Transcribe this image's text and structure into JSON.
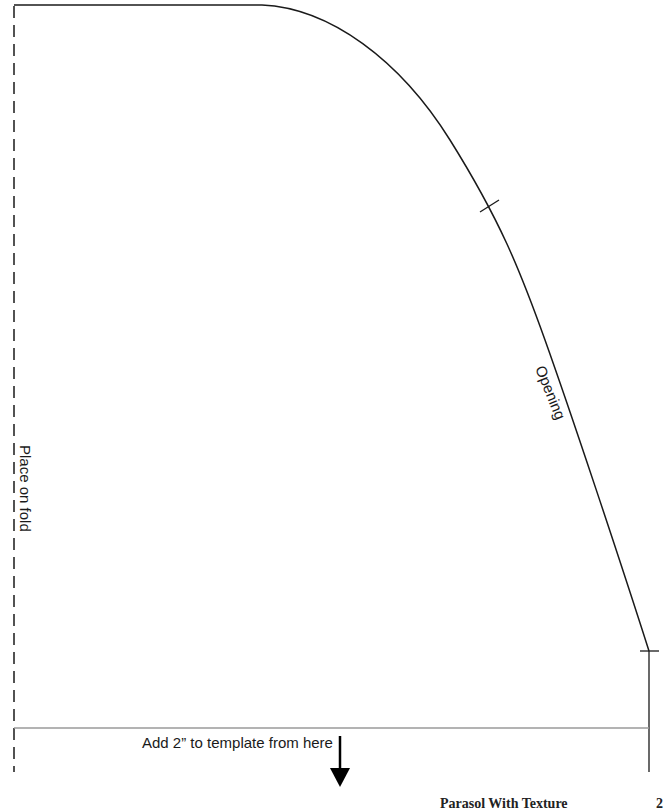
{
  "template": {
    "fold_label": "Place on fold",
    "opening_label": "Opening",
    "extension_label": "Add 2” to template from here",
    "notches": 2
  },
  "footer": {
    "title": "Parasol With Texture",
    "page_number": "2"
  },
  "colors": {
    "outline": "#1a1a1a",
    "guide_line": "#9a9a9a",
    "background": "#ffffff"
  }
}
